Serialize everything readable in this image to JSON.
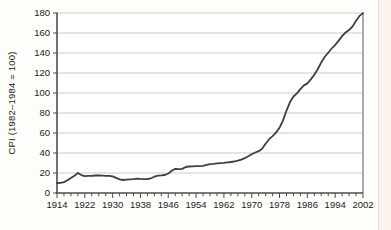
{
  "figure": {
    "background": "#fdfdfa",
    "page_edge_color": "#faf3ee",
    "page_edge_border_color": "#e7d8d1"
  },
  "chart_data": {
    "type": "line",
    "title": "",
    "xlabel": "",
    "ylabel": "CPI (1982–1984 = 100)",
    "ylim": [
      0,
      180
    ],
    "xlim": [
      1914,
      2002
    ],
    "y_ticks": [
      0,
      20,
      40,
      60,
      80,
      100,
      120,
      140,
      160,
      180
    ],
    "x_tick_labels": [
      1914,
      1922,
      1930,
      1938,
      1946,
      1954,
      1962,
      1970,
      1978,
      1986,
      1994,
      2002
    ],
    "x_minor_tick_step": 2,
    "grid": "horizontal",
    "legend": "none",
    "x": [
      1914,
      1915,
      1916,
      1917,
      1918,
      1919,
      1920,
      1921,
      1922,
      1923,
      1924,
      1925,
      1926,
      1927,
      1928,
      1929,
      1930,
      1931,
      1932,
      1933,
      1934,
      1935,
      1936,
      1937,
      1938,
      1939,
      1940,
      1941,
      1942,
      1943,
      1944,
      1945,
      1946,
      1947,
      1948,
      1949,
      1950,
      1951,
      1952,
      1953,
      1954,
      1955,
      1956,
      1957,
      1958,
      1959,
      1960,
      1961,
      1962,
      1963,
      1964,
      1965,
      1966,
      1967,
      1968,
      1969,
      1970,
      1971,
      1972,
      1973,
      1974,
      1975,
      1976,
      1977,
      1978,
      1979,
      1980,
      1981,
      1982,
      1983,
      1984,
      1985,
      1986,
      1987,
      1988,
      1989,
      1990,
      1991,
      1992,
      1993,
      1994,
      1995,
      1996,
      1997,
      1998,
      1999,
      2000,
      2001,
      2002
    ],
    "series": [
      {
        "name": "CPI",
        "values": [
          10.0,
          10.1,
          10.9,
          12.8,
          15.1,
          17.3,
          20.0,
          17.9,
          16.8,
          17.1,
          17.1,
          17.5,
          17.7,
          17.4,
          17.1,
          17.1,
          16.7,
          15.2,
          13.7,
          13.0,
          13.4,
          13.7,
          13.9,
          14.4,
          14.1,
          13.9,
          14.0,
          14.7,
          16.3,
          17.3,
          17.6,
          18.0,
          19.5,
          22.3,
          24.1,
          23.8,
          24.1,
          26.0,
          26.5,
          26.7,
          26.9,
          26.8,
          27.2,
          28.1,
          28.9,
          29.1,
          29.6,
          29.9,
          30.2,
          30.6,
          31.0,
          31.5,
          32.4,
          33.4,
          34.8,
          36.7,
          38.8,
          40.5,
          41.8,
          44.4,
          49.3,
          53.8,
          56.9,
          60.6,
          65.2,
          72.6,
          82.4,
          90.9,
          96.5,
          99.6,
          103.9,
          107.6,
          109.6,
          113.6,
          118.3,
          124.0,
          130.7,
          136.2,
          140.3,
          144.5,
          148.2,
          152.4,
          156.9,
          160.5,
          163.0,
          166.6,
          172.2,
          177.1,
          179.9
        ]
      }
    ],
    "style": {
      "line_color": "#3f3f3f",
      "line_width": 1.8,
      "gridline_color": "#cbcbcb",
      "axis_color": "#4d4d4d",
      "right_border_color": "#979797",
      "plot_bg": "#ffffff",
      "tick_text_color": "#1c1c1c",
      "tick_font_size": 9.5
    },
    "layout": {
      "plot_left": 57,
      "plot_right": 363,
      "plot_top": 13,
      "plot_bottom": 193
    }
  }
}
